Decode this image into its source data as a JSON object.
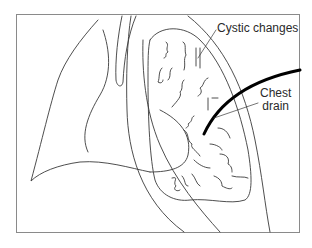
{
  "figure": {
    "type": "anatomical line drawing",
    "colors": {
      "line": "#3a3a3a",
      "drain": "#000000",
      "frame": "#8a8a8a",
      "background": "#ffffff"
    }
  },
  "labels": {
    "cystic_changes": "Cystic changes",
    "chest_drain_line1": "Chest",
    "chest_drain_line2": "drain"
  }
}
